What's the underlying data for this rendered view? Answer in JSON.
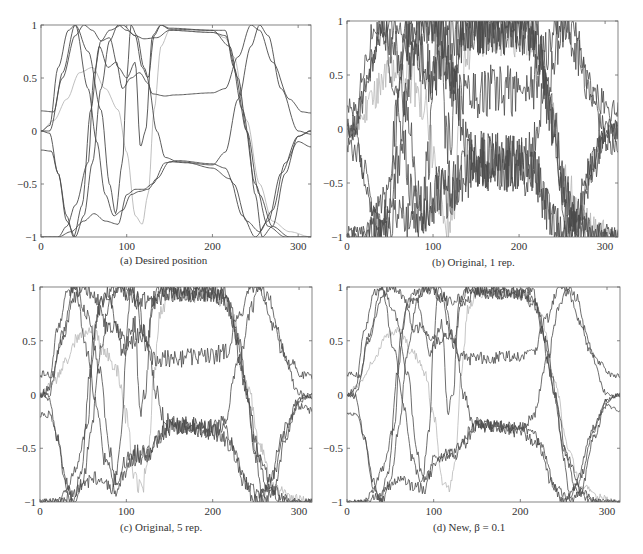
{
  "figure": {
    "panels": [
      {
        "id": "a",
        "caption": "(a)  Desired position"
      },
      {
        "id": "b",
        "caption": "(b)  Original, 1 rep."
      },
      {
        "id": "c",
        "caption": "(c)  Original, 5 rep."
      },
      {
        "id": "d",
        "caption": "(d)  New, β = 0.1"
      }
    ]
  },
  "chart_data": [
    {
      "type": "line",
      "title": "(a) Desired position",
      "xlabel": "",
      "ylabel": "",
      "xlim": [
        0,
        315
      ],
      "ylim": [
        -1,
        1
      ],
      "xticks": [
        0,
        100,
        200,
        300
      ],
      "yticks": [
        -1,
        -0.5,
        0,
        0.5,
        1
      ],
      "ytick_labels": [
        "−1",
        "−0.5",
        "0",
        "0.5",
        "1"
      ],
      "grid": false,
      "noise": 0,
      "series": [
        {
          "name": "joint 1",
          "color": "#4a4a4a",
          "points": [
            [
              0,
              0.19
            ],
            [
              15,
              0.18
            ],
            [
              25,
              0.55
            ],
            [
              40,
              1
            ],
            [
              55,
              0.75
            ],
            [
              70,
              0.2
            ],
            [
              80,
              -0.5
            ],
            [
              87,
              -0.78
            ],
            [
              95,
              -0.3
            ],
            [
              100,
              0.5
            ],
            [
              105,
              1
            ],
            [
              112,
              0.9
            ],
            [
              120,
              0.6
            ],
            [
              130,
              0.35
            ],
            [
              145,
              0.33
            ],
            [
              155,
              0.34
            ],
            [
              200,
              0.36
            ],
            [
              215,
              0.4
            ],
            [
              230,
              0.7
            ],
            [
              245,
              1
            ],
            [
              255,
              0.95
            ],
            [
              270,
              0.65
            ],
            [
              290,
              0.3
            ],
            [
              305,
              0.18
            ],
            [
              315,
              0.17
            ]
          ]
        },
        {
          "name": "joint 2",
          "color": "#4a4a4a",
          "points": [
            [
              0,
              0
            ],
            [
              10,
              -0.02
            ],
            [
              20,
              -0.4
            ],
            [
              30,
              -0.85
            ],
            [
              40,
              -1
            ],
            [
              50,
              -0.8
            ],
            [
              60,
              -0.3
            ],
            [
              70,
              0.4
            ],
            [
              80,
              0.85
            ],
            [
              90,
              1
            ],
            [
              100,
              0.95
            ],
            [
              110,
              0.9
            ],
            [
              120,
              0.87
            ],
            [
              135,
              0.88
            ],
            [
              150,
              0.95
            ],
            [
              200,
              0.93
            ],
            [
              215,
              0.9
            ],
            [
              230,
              0.5
            ],
            [
              240,
              0
            ],
            [
              250,
              -0.6
            ],
            [
              258,
              -1
            ],
            [
              270,
              -0.9
            ],
            [
              285,
              -0.4
            ],
            [
              300,
              -0.05
            ],
            [
              315,
              0
            ]
          ]
        },
        {
          "name": "joint 3",
          "color": "#4a4a4a",
          "points": [
            [
              0,
              -0.18
            ],
            [
              12,
              -0.19
            ],
            [
              20,
              -0.4
            ],
            [
              30,
              -0.8
            ],
            [
              38,
              -1
            ],
            [
              48,
              -0.7
            ],
            [
              58,
              0.2
            ],
            [
              68,
              0.8
            ],
            [
              78,
              0.6
            ],
            [
              88,
              0.65
            ],
            [
              95,
              0.4
            ],
            [
              105,
              0.5
            ],
            [
              115,
              0.55
            ],
            [
              125,
              0.45
            ],
            [
              135,
              0.0
            ],
            [
              145,
              -0.25
            ],
            [
              160,
              -0.29
            ],
            [
              200,
              -0.32
            ],
            [
              215,
              -0.2
            ],
            [
              230,
              0.3
            ],
            [
              245,
              0.8
            ],
            [
              255,
              1
            ],
            [
              265,
              0.9
            ],
            [
              280,
              0.4
            ],
            [
              300,
              0.0
            ],
            [
              315,
              -0.03
            ]
          ]
        },
        {
          "name": "joint 4",
          "color": "#4a4a4a",
          "points": [
            [
              0,
              0.0
            ],
            [
              10,
              0.05
            ],
            [
              20,
              0.6
            ],
            [
              32,
              0.95
            ],
            [
              40,
              1
            ],
            [
              55,
              0.4
            ],
            [
              65,
              -0.1
            ],
            [
              75,
              -0.6
            ],
            [
              85,
              -0.8
            ],
            [
              95,
              -0.75
            ],
            [
              105,
              -0.6
            ],
            [
              115,
              -0.57
            ],
            [
              125,
              -0.55
            ],
            [
              135,
              -0.45
            ],
            [
              150,
              -0.29
            ],
            [
              170,
              -0.3
            ],
            [
              200,
              -0.35
            ],
            [
              220,
              -0.45
            ],
            [
              235,
              -0.8
            ],
            [
              250,
              -1
            ],
            [
              265,
              -0.85
            ],
            [
              280,
              -0.4
            ],
            [
              300,
              -0.05
            ],
            [
              315,
              0.0
            ]
          ]
        },
        {
          "name": "joint 5",
          "color": "#4a4a4a",
          "points": [
            [
              0,
              -1
            ],
            [
              20,
              -1
            ],
            [
              30,
              -0.9
            ],
            [
              40,
              -0.7
            ],
            [
              55,
              -0.3
            ],
            [
              62,
              0.55
            ],
            [
              70,
              0.85
            ],
            [
              80,
              0.95
            ],
            [
              95,
              1
            ],
            [
              110,
              0.9
            ],
            [
              118,
              0.6
            ],
            [
              125,
              0.5
            ],
            [
              132,
              0.9
            ],
            [
              140,
              1
            ],
            [
              150,
              0.97
            ],
            [
              200,
              0.95
            ],
            [
              215,
              0.95
            ],
            [
              225,
              0.6
            ],
            [
              240,
              0
            ],
            [
              255,
              -0.6
            ],
            [
              270,
              -0.9
            ],
            [
              290,
              -1
            ],
            [
              315,
              -1
            ]
          ]
        },
        {
          "name": "joint 6",
          "color": "#4a4a4a",
          "points": [
            [
              0,
              -1
            ],
            [
              20,
              -1
            ],
            [
              35,
              -0.95
            ],
            [
              50,
              -0.85
            ],
            [
              62,
              -0.78
            ],
            [
              75,
              -0.85
            ],
            [
              90,
              -0.88
            ],
            [
              100,
              -0.6
            ],
            [
              110,
              -0.55
            ],
            [
              120,
              -0.55
            ],
            [
              130,
              -0.5
            ],
            [
              145,
              -0.3
            ],
            [
              160,
              -0.28
            ],
            [
              200,
              -0.31
            ],
            [
              215,
              -0.35
            ],
            [
              225,
              -0.5
            ],
            [
              240,
              -0.85
            ],
            [
              255,
              -0.95
            ],
            [
              270,
              -0.75
            ],
            [
              285,
              -0.3
            ],
            [
              300,
              -0.1
            ],
            [
              315,
              -0.15
            ]
          ]
        },
        {
          "name": "joint 7",
          "color": "#4a4a4a",
          "points": [
            [
              0,
              0.0
            ],
            [
              10,
              0.0
            ],
            [
              25,
              0.5
            ],
            [
              40,
              0.9
            ],
            [
              50,
              1
            ],
            [
              60,
              0.95
            ],
            [
              70,
              0.85
            ],
            [
              80,
              0.88
            ],
            [
              90,
              0.6
            ],
            [
              100,
              0.5
            ],
            [
              110,
              0.65
            ],
            [
              116,
              -0.15
            ],
            [
              122,
              0.0
            ],
            [
              130,
              0.9
            ],
            [
              140,
              1
            ],
            [
              150,
              0.96
            ],
            [
              200,
              0.95
            ],
            [
              220,
              0.8
            ],
            [
              235,
              0.2
            ],
            [
              250,
              -0.5
            ],
            [
              265,
              -0.9
            ],
            [
              285,
              -1
            ],
            [
              300,
              -1
            ],
            [
              315,
              -1
            ]
          ]
        },
        {
          "name": "joint 8 (light)",
          "color": "#b8b8b8",
          "points": [
            [
              0,
              0.0
            ],
            [
              15,
              0.1
            ],
            [
              30,
              0.3
            ],
            [
              45,
              0.55
            ],
            [
              60,
              0.6
            ],
            [
              75,
              0.4
            ],
            [
              90,
              0.2
            ],
            [
              100,
              -0.2
            ],
            [
              110,
              -0.8
            ],
            [
              118,
              -0.88
            ],
            [
              125,
              -0.6
            ],
            [
              132,
              0.2
            ],
            [
              140,
              0.8
            ],
            [
              150,
              0.95
            ],
            [
              200,
              0.93
            ],
            [
              215,
              0.88
            ],
            [
              225,
              0.7
            ],
            [
              240,
              0.1
            ],
            [
              255,
              -0.5
            ],
            [
              270,
              -0.85
            ],
            [
              290,
              -0.95
            ],
            [
              315,
              -1
            ]
          ]
        }
      ]
    },
    {
      "type": "line",
      "title": "(b) Original, 1 rep.",
      "xlim": [
        0,
        315
      ],
      "ylim": [
        -1,
        1
      ],
      "xticks": [
        0,
        100,
        200,
        300
      ],
      "yticks": [
        -1,
        -0.5,
        0,
        0.5,
        1
      ],
      "grid": false,
      "noise": 0.28,
      "series_from": "a"
    },
    {
      "type": "line",
      "title": "(c) Original, 5 rep.",
      "xlim": [
        0,
        315
      ],
      "ylim": [
        -1,
        1
      ],
      "xticks": [
        0,
        100,
        200,
        300
      ],
      "yticks": [
        -1,
        -0.5,
        0,
        0.5,
        1
      ],
      "grid": false,
      "noise": 0.09,
      "series_from": "a"
    },
    {
      "type": "line",
      "title": "(d) New, β = 0.1",
      "xlim": [
        0,
        315
      ],
      "ylim": [
        -1,
        1
      ],
      "xticks": [
        0,
        100,
        200,
        300
      ],
      "yticks": [
        -1,
        -0.5,
        0,
        0.5,
        1
      ],
      "grid": false,
      "noise": 0.06,
      "series_from": "a"
    }
  ]
}
